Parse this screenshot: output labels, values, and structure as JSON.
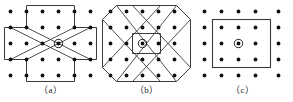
{
  "figure": {
    "type": "lattice-unit-cell-diagram",
    "background_color": "#ffffff",
    "line_color": "#3c3c3c",
    "dot_color": "#111111",
    "panel_count": 3
  },
  "lattice": {
    "description": "5 by 5 square array of lattice points",
    "rows": 5,
    "cols": 5,
    "dot_radius": 1.9,
    "spacing_x": 16,
    "spacing_y": 16,
    "origin_x": 8.5,
    "origin_y": 8,
    "center_marker": {
      "name": "circled-center-point",
      "inner_radius": 1.9,
      "outer_radius": 4.2
    }
  },
  "panels": [
    {
      "id": "a",
      "caption": "（a）",
      "cell_shape": "greek-cross-plus-with-x-diagonals",
      "outline_points": "24.5,0.5 72.5,0.5 72.5,24.5 96.5,24.5 96.5,56.5 72.5,56.5 72.5,80.5 24.5,80.5 24.5,56.5 0.5,56.5 0.5,24.5 24.5,24.5",
      "diagonals": [
        "8.5,24.5 72.5,56.5",
        "8.5,56.5 72.5,24.5",
        "24.5,24.5 88.5,56.5",
        "24.5,56.5 88.5,24.5"
      ]
    },
    {
      "id": "b",
      "caption": "（b）",
      "cell_shape": "four-chamfered-octagon-quadrants-with-x-diagonals",
      "outline_points": "16.5,0.5 80.5,0.5 96.5,16.5 96.5,64.5 80.5,80.5 16.5,80.5 0.5,64.5 0.5,16.5",
      "center_square": "32.5,32.5 64.5,32.5 64.5,48.5 32.5,48.5",
      "chamfers": [
        "0.5,16.5 16.5,0.5",
        "80.5,0.5 96.5,16.5",
        "96.5,64.5 80.5,80.5",
        "16.5,80.5 0.5,64.5"
      ],
      "diagonals": [
        "16.5,0.5 80.5,80.5",
        "80.5,0.5 16.5,80.5",
        "32.5,0.5 96.5,64.5",
        "64.5,0.5 0.5,64.5",
        "0.5,16.5 64.5,80.5",
        "96.5,16.5 32.5,80.5"
      ]
    },
    {
      "id": "c",
      "caption": "（c）",
      "cell_shape": "simple-square-enclosing-inner-3x3",
      "outline_points": "16.5,8.5 80.5,8.5 80.5,72.5 16.5,72.5"
    }
  ]
}
